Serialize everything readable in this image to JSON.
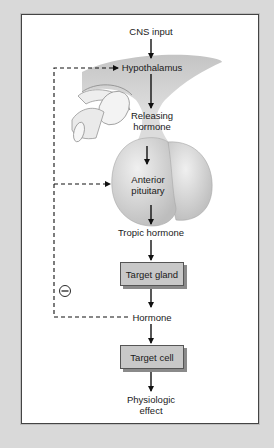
{
  "diagram": {
    "nodes": {
      "cns_input": "CNS input",
      "hypothalamus": "Hypothalamus",
      "releasing_hormone_line1": "Releasing",
      "releasing_hormone_line2": "hormone",
      "anterior_pituitary_line1": "Anterior",
      "anterior_pituitary_line2": "pituitary",
      "tropic_hormone": "Tropic hormone",
      "target_gland": "Target gland",
      "hormone": "Hormone",
      "target_cell": "Target cell",
      "physiologic_effect_line1": "Physiologic",
      "physiologic_effect_line2": "effect"
    },
    "feedback_symbol": "⊖",
    "feedback_meaning": "negative-feedback",
    "edges": [
      {
        "from": "CNS input",
        "to": "Hypothalamus",
        "style": "solid"
      },
      {
        "from": "Hypothalamus",
        "to": "Releasing hormone",
        "style": "solid"
      },
      {
        "from": "Releasing hormone",
        "to": "Anterior pituitary",
        "style": "solid"
      },
      {
        "from": "Anterior pituitary",
        "to": "Tropic hormone",
        "style": "solid"
      },
      {
        "from": "Tropic hormone",
        "to": "Target gland",
        "style": "solid"
      },
      {
        "from": "Target gland",
        "to": "Hormone",
        "style": "solid"
      },
      {
        "from": "Hormone",
        "to": "Target cell",
        "style": "solid"
      },
      {
        "from": "Target cell",
        "to": "Physiologic effect",
        "style": "solid"
      },
      {
        "from": "Hormone",
        "to": "Hypothalamus",
        "style": "dashed"
      },
      {
        "from": "Hormone",
        "to": "Anterior pituitary",
        "style": "dashed"
      }
    ],
    "colors": {
      "background": "#d9d9d9",
      "panel": "#ffffff",
      "box_fill": "#c8c8c8",
      "anatomy_fill": "#dcdcdc"
    }
  }
}
